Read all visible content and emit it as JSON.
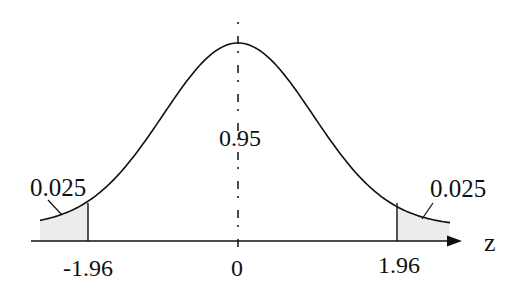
{
  "diagram": {
    "axis_label": "z",
    "center_label": "0.95",
    "left_tail_label": "0.025",
    "right_tail_label": "0.025",
    "ticks": [
      {
        "value": -1.96,
        "label": "-1.96"
      },
      {
        "value": 0,
        "label": "0"
      },
      {
        "value": 1.96,
        "label": "1.96"
      }
    ],
    "colors": {
      "line": "#111111",
      "tail_fill": "#ececec",
      "background": "#ffffff"
    }
  },
  "chart_data": {
    "type": "line",
    "title": "",
    "xlabel": "z",
    "ylabel": "",
    "x": [
      -2.6,
      -1.96,
      -1.0,
      0,
      1.0,
      1.96,
      2.6
    ],
    "areas": {
      "left_tail": 0.025,
      "center": 0.95,
      "right_tail": 0.025
    },
    "critical_values": [
      -1.96,
      1.96
    ],
    "annotations": [
      "0.025",
      "0.95",
      "0.025"
    ],
    "grid": false
  }
}
